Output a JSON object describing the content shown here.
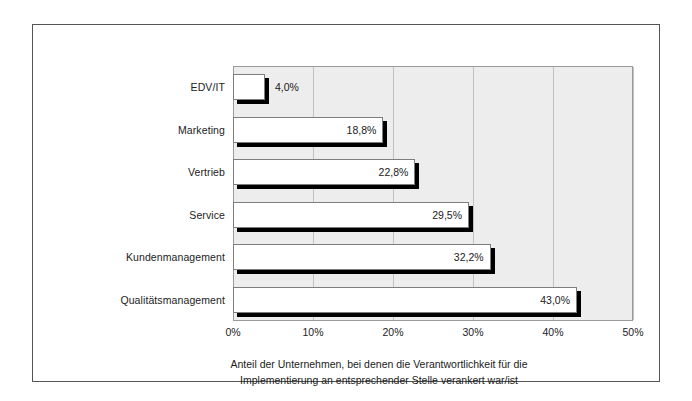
{
  "chart_data": {
    "type": "bar",
    "orientation": "horizontal",
    "title": "",
    "subtitle": "",
    "xlabel": "",
    "ylabel": "",
    "categories": [
      "EDV/IT",
      "Marketing",
      "Vertrieb",
      "Service",
      "Kundenmanagement",
      "Qualitätsmanagement"
    ],
    "values": [
      4.0,
      18.8,
      22.8,
      29.5,
      32.2,
      43.0
    ],
    "value_labels": [
      "4,0%",
      "18,8%",
      "22,8%",
      "29,5%",
      "32,2%",
      "43,0%"
    ],
    "label_placement": [
      "outside",
      "inside",
      "inside",
      "inside",
      "inside",
      "inside"
    ],
    "xlim": [
      0,
      50
    ],
    "xticks": [
      0,
      10,
      20,
      30,
      40,
      50
    ],
    "xtick_labels": [
      "0%",
      "10%",
      "20%",
      "30%",
      "40%",
      "50%"
    ],
    "grid": "vertical",
    "legend": "none",
    "bar_color": "#ffffff",
    "bar_edge_color": "#7d7d7d",
    "bar_shadow_color": "#000000",
    "plot_background": "#ededed",
    "gridline_color": "#c2c2c2",
    "figure_background": "#ffffff",
    "frame_color": "#555555",
    "annotation": "Anteil der Unternehmen, bei denen die Verantwortlichkeit für die Implementierung an entsprechender Stelle verankert war/ist"
  },
  "caption": {
    "line1": "Anteil der Unternehmen, bei denen die Verantwortlichkeit für die",
    "line2": "Implementierung an entsprechender Stelle verankert war/ist"
  }
}
